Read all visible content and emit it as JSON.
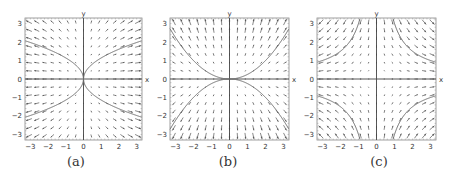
{
  "figure": {
    "panels": [
      {
        "id": "a",
        "caption": "(a)",
        "left": 0,
        "plot_left": 25,
        "plot_right": 142
      },
      {
        "id": "b",
        "caption": "(b)",
        "left": 152,
        "plot_left": 170,
        "plot_right": 289
      },
      {
        "id": "c",
        "caption": "(c)",
        "left": 302,
        "plot_left": 317,
        "plot_right": 436
      }
    ],
    "plot_top": 18,
    "plot_bottom": 140,
    "colors": {
      "arrow": "#555555",
      "curve": "#6a6a6a",
      "axis": "#444444",
      "frame": "#888888",
      "text": "#333333"
    }
  },
  "chart_data": [
    {
      "type": "quiver",
      "title": "(a)",
      "xlabel": "x",
      "ylabel": "y",
      "xlim": [
        -3.3,
        3.3
      ],
      "ylim": [
        -3.3,
        3.3
      ],
      "xticks": [
        -3,
        -2,
        -1,
        0,
        1,
        2,
        3
      ],
      "yticks": [
        -3,
        -2,
        -1,
        0,
        1,
        2,
        3
      ],
      "field": {
        "u": "x",
        "v": "y/2"
      },
      "curves": [
        {
          "name": "upper-right",
          "equation": "y = sqrt(1.3*x)",
          "x_range": [
            0,
            3.3
          ]
        },
        {
          "name": "upper-left",
          "equation": "y = sqrt(-1.3*x)",
          "x_range": [
            -3.3,
            0
          ]
        },
        {
          "name": "lower-right",
          "equation": "y = -sqrt(1.3*x)",
          "x_range": [
            0,
            3.3
          ]
        },
        {
          "name": "lower-left",
          "equation": "y = -sqrt(-1.3*x)",
          "x_range": [
            -3.3,
            0
          ]
        }
      ],
      "grid": false
    },
    {
      "type": "quiver",
      "title": "(b)",
      "xlabel": "x",
      "ylabel": "y",
      "xlim": [
        -3.3,
        3.3
      ],
      "ylim": [
        -3.3,
        3.3
      ],
      "xticks": [
        -3,
        -2,
        -1,
        0,
        1,
        2,
        3
      ],
      "yticks": [
        -3,
        -2,
        -1,
        0,
        1,
        2,
        3
      ],
      "field": {
        "u": "x/2",
        "v": "y"
      },
      "curves": [
        {
          "name": "upper",
          "equation": "y = x^2/4",
          "x_range": [
            -3.3,
            3.3
          ]
        },
        {
          "name": "lower",
          "equation": "y = -x^2/4",
          "x_range": [
            -3.3,
            3.3
          ]
        }
      ],
      "grid": false
    },
    {
      "type": "quiver",
      "title": "(c)",
      "xlabel": "x",
      "ylabel": "y",
      "xlim": [
        -3.3,
        3.3
      ],
      "ylim": [
        -3.3,
        3.3
      ],
      "xticks": [
        -3,
        -2,
        -1,
        0,
        1,
        2,
        3
      ],
      "yticks": [
        -3,
        -2,
        -1,
        0,
        1,
        2,
        3
      ],
      "field": {
        "u": "x",
        "v": "-y"
      },
      "curves": [
        {
          "name": "Q1",
          "equation": "x*y = 3",
          "quadrant": 1
        },
        {
          "name": "Q2",
          "equation": "x*y = -3",
          "quadrant": 2
        },
        {
          "name": "Q3",
          "equation": "x*y = 3",
          "quadrant": 3
        },
        {
          "name": "Q4",
          "equation": "x*y = -3",
          "quadrant": 4
        }
      ],
      "grid": false
    }
  ]
}
